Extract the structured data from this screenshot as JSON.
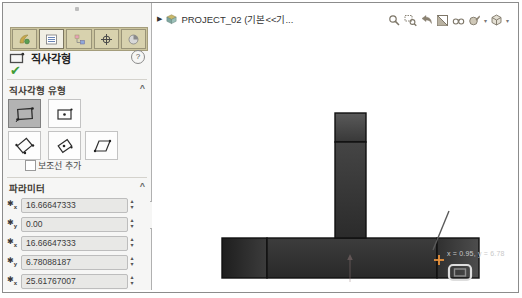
{
  "panel": {
    "tabs": [
      {
        "icon": "featuremanager-tree-icon"
      },
      {
        "icon": "propertymanager-icon",
        "active": true
      },
      {
        "icon": "configurationmanager-icon"
      },
      {
        "icon": "dimxpertmanager-icon"
      },
      {
        "icon": "displaymanager-icon"
      }
    ],
    "title": "직사각형",
    "help": "?",
    "ok_check": "✔",
    "chevron": "^",
    "type_section_label": "직사각형 유형",
    "construction_checkbox_label": "보조선 추가",
    "parameters_label": "파라미터",
    "spinner_up": "▴",
    "spinner_down": "▾",
    "parameters": [
      {
        "axis": "x",
        "value": "16.66647333"
      },
      {
        "axis": "y",
        "value": "0.00"
      },
      {
        "axis": "x",
        "value": "16.66647333"
      },
      {
        "axis": "y",
        "value": "6.78088187"
      },
      {
        "axis": "x",
        "value": "25.61767007"
      }
    ]
  },
  "canvas": {
    "expander": "▶",
    "tree_label": "PROJECT_02 (기본<<기...",
    "caret": "▾",
    "cursor_label": "x = 0.95, y = 6.78"
  },
  "colors": {
    "ok_green": "#3f9c35",
    "tab_strip": "#cbc49e",
    "selected_button": "#b3b3b3",
    "shape_fill": "#333333",
    "crosshair_orange": "#e8923d"
  }
}
